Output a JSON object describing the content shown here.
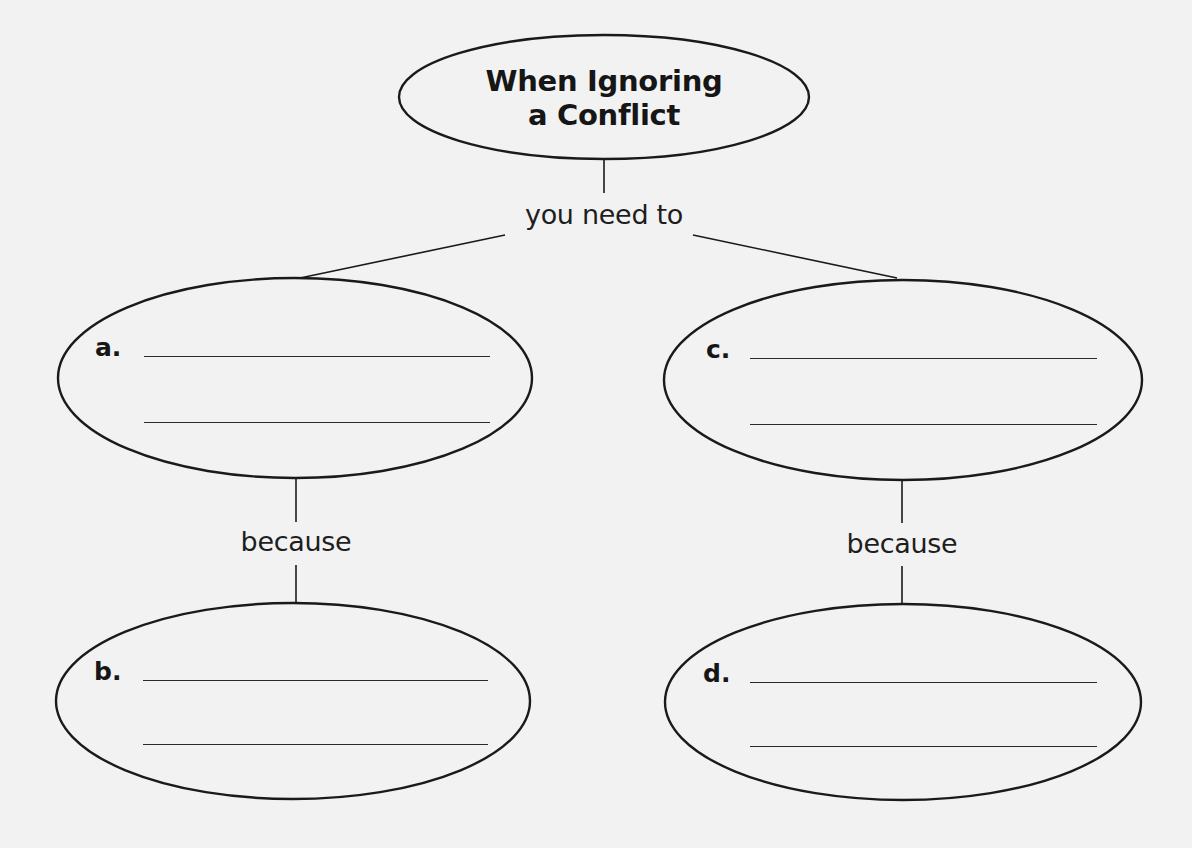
{
  "diagram": {
    "type": "concept-map",
    "title": {
      "line1": "When Ignoring",
      "line2": "a Conflict"
    },
    "connectors": {
      "main": "you need to",
      "left": "because",
      "right": "because"
    },
    "nodes": [
      {
        "id": "a",
        "label": "a.",
        "answer_lines": [
          "",
          ""
        ]
      },
      {
        "id": "b",
        "label": "b.",
        "answer_lines": [
          "",
          ""
        ]
      },
      {
        "id": "c",
        "label": "c.",
        "answer_lines": [
          "",
          ""
        ]
      },
      {
        "id": "d",
        "label": "d.",
        "answer_lines": [
          "",
          ""
        ]
      }
    ],
    "colors": {
      "background": "#f2f2f2",
      "stroke": "#1a1a1a",
      "text": "#161616"
    }
  }
}
